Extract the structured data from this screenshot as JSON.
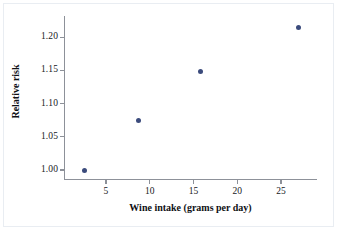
{
  "chart_data": {
    "type": "scatter",
    "title": "",
    "xlabel": "Wine intake (grams per day)",
    "ylabel": "Relative risk",
    "x": [
      2.5,
      8.7,
      15.8,
      27.0
    ],
    "values": [
      1.0,
      1.075,
      1.148,
      1.215
    ],
    "points": [
      {
        "x": 2.5,
        "y": 1.0
      },
      {
        "x": 8.7,
        "y": 1.075
      },
      {
        "x": 15.8,
        "y": 1.148
      },
      {
        "x": 27.0,
        "y": 1.215
      }
    ],
    "xlim": [
      0.2,
      29.0
    ],
    "ylim": [
      0.985,
      1.232
    ],
    "xticks": [
      5,
      10,
      15,
      20,
      25
    ],
    "yticks": [
      1.0,
      1.05,
      1.1,
      1.15,
      1.2
    ],
    "xticklabels": [
      "5",
      "10",
      "15",
      "20",
      "25"
    ],
    "yticklabels": [
      "1.00",
      "1.05",
      "1.10",
      "1.15",
      "1.20"
    ],
    "grid": false,
    "legend": null,
    "marker_color": "#3b4b7c",
    "axis_color": "#8d9199",
    "background_color": "#ffffff"
  }
}
